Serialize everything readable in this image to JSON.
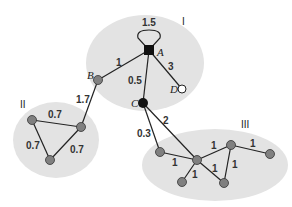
{
  "diagram": {
    "type": "weighted-graph-clusters",
    "clusters": [
      {
        "id": "I",
        "label": "I"
      },
      {
        "id": "II",
        "label": "II"
      },
      {
        "id": "III",
        "label": "III"
      }
    ],
    "nodes": [
      {
        "id": "A",
        "label": "A",
        "cluster": "I",
        "style": "black"
      },
      {
        "id": "B",
        "label": "B",
        "cluster": "I",
        "style": "gray"
      },
      {
        "id": "C",
        "label": "C",
        "cluster": "I",
        "style": "black"
      },
      {
        "id": "D",
        "label": "D",
        "cluster": "I",
        "style": "white"
      }
    ],
    "edges": {
      "A_loop": "1.5",
      "A_B": "1",
      "A_C": "0.5",
      "A_D": "3",
      "B_II": "1.7",
      "II_top": "0.7",
      "II_left": "0.7",
      "II_right": "0.7",
      "C_III1": "0.3",
      "C_hub": "2",
      "III1_hub": "1",
      "hub_n3": "1",
      "hub_bl": "1",
      "hub_br": "1",
      "n3_br": "1",
      "n3_n4": "1"
    }
  }
}
